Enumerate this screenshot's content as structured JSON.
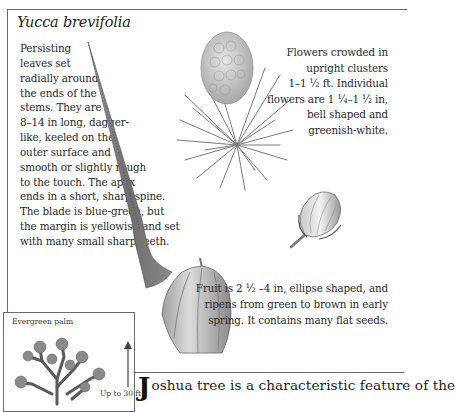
{
  "species_title": "Yucca brevifolia",
  "leaf_description": {
    "lines": [
      "Persisting",
      "leaves set",
      "radially around",
      "the ends of the",
      "stems. They are",
      "8–14 in long, dagger-",
      "like, keeled on the",
      "outer surface and",
      "smooth or slightly rough",
      "to the touch. The apex",
      "ends in a short, sharp spine.",
      "The blade is blue-green, but",
      "the margin is yellowish and set",
      "with many small sharp teeth."
    ]
  },
  "flower_description": {
    "lines": [
      "Flowers crowded in",
      "upright clusters",
      "1–1 ½ ft. Individual",
      "flowers are 1 ¼–1 ½ in,",
      "bell shaped and",
      "greenish-white."
    ]
  },
  "fruit_description": {
    "lines": [
      "Fruit is 2 ½ –4 in, ellipse shaped, and",
      "ripens from green to brown in early",
      "spring. It contains many flat seeds."
    ]
  },
  "habit_box": {
    "label": "Evergreen palm",
    "height_label": "Up to 30 ft"
  },
  "body": {
    "dropcap": "J",
    "text": "oshua tree is a characteristic feature of the"
  },
  "illustrations": {
    "leaf": "leaf-spine-illustration",
    "flower_cluster": "flower-cluster-illustration",
    "flower_bud": "flower-bud-illustration",
    "fruit": "fruit-illustration",
    "tree": "joshua-tree-silhouette",
    "height_arrow": "arrow-up-icon"
  }
}
